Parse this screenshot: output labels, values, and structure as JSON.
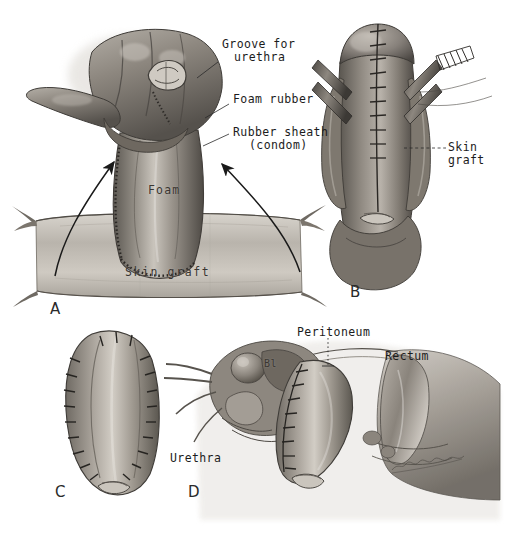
{
  "plate": {
    "title": "Surgical technique plate: staged urethral / phallic reconstruction",
    "medium": "grayscale wash and graphite illustration",
    "background_color": "#ffffff",
    "ink_color": "#1c1c1c",
    "signature": "artist signature (cursive, illegible)"
  },
  "panels": [
    {
      "id": "A",
      "letter": "A",
      "caption": "Hand supporting shaft over foam-rubber core wrapped in rubber sheath, positioned above the flat skin graft",
      "labels": [
        {
          "name": "groove-for-urethra",
          "text": "Groove for\nurethra",
          "leader": "line"
        },
        {
          "name": "foam-rubber",
          "text": "Foam rubber",
          "leader": "line"
        },
        {
          "name": "rubber-sheath",
          "text": "Rubber sheath\n(condom)",
          "leader": "line"
        },
        {
          "name": "foam-overlay",
          "text": "Foam",
          "leader": "none"
        },
        {
          "name": "skin-graft-sheet",
          "text": "Skin graft",
          "leader": "none"
        }
      ],
      "arrows": 2
    },
    {
      "id": "B",
      "letter": "B",
      "caption": "Graft sutured around the shaft, held by clamps with midline suture line",
      "labels": [
        {
          "name": "skin-graft",
          "text": "Skin\ngraft",
          "leader": "dashed"
        }
      ],
      "arrows": 0
    },
    {
      "id": "C",
      "letter": "C",
      "caption": "Completed tubed skin graft with continuous suture line along both margins",
      "labels": [],
      "arrows": 0
    },
    {
      "id": "D",
      "letter": "D",
      "caption": "Sagittal section of the pelvis showing the implanted tubed graft in relation to bladder, peritoneum and rectum",
      "labels": [
        {
          "name": "peritoneum",
          "text": "Peritoneum",
          "leader": "dotted"
        },
        {
          "name": "rectum",
          "text": "Rectum",
          "leader": "none"
        },
        {
          "name": "urethra",
          "text": "Urethra",
          "leader": "none"
        },
        {
          "name": "bladder-abbrev",
          "text": "Bl",
          "leader": "none"
        }
      ],
      "arrows": 0
    }
  ],
  "labels_flat": {
    "groove_for_urethra_line1": "Groove for",
    "groove_for_urethra_line2": "urethra",
    "foam_rubber": "Foam rubber",
    "rubber_sheath_line1": "Rubber sheath",
    "rubber_sheath_line2": "(condom)",
    "foam_overlay": "Foam",
    "skin_graft_sheet": "Skin graft",
    "skin_graft_b_line1": "Skin",
    "skin_graft_b_line2": "graft",
    "peritoneum": "Peritoneum",
    "rectum": "Rectum",
    "urethra": "Urethra",
    "bladder": "Bl",
    "letter_a": "A",
    "letter_b": "B",
    "letter_c": "C",
    "letter_d": "D"
  }
}
